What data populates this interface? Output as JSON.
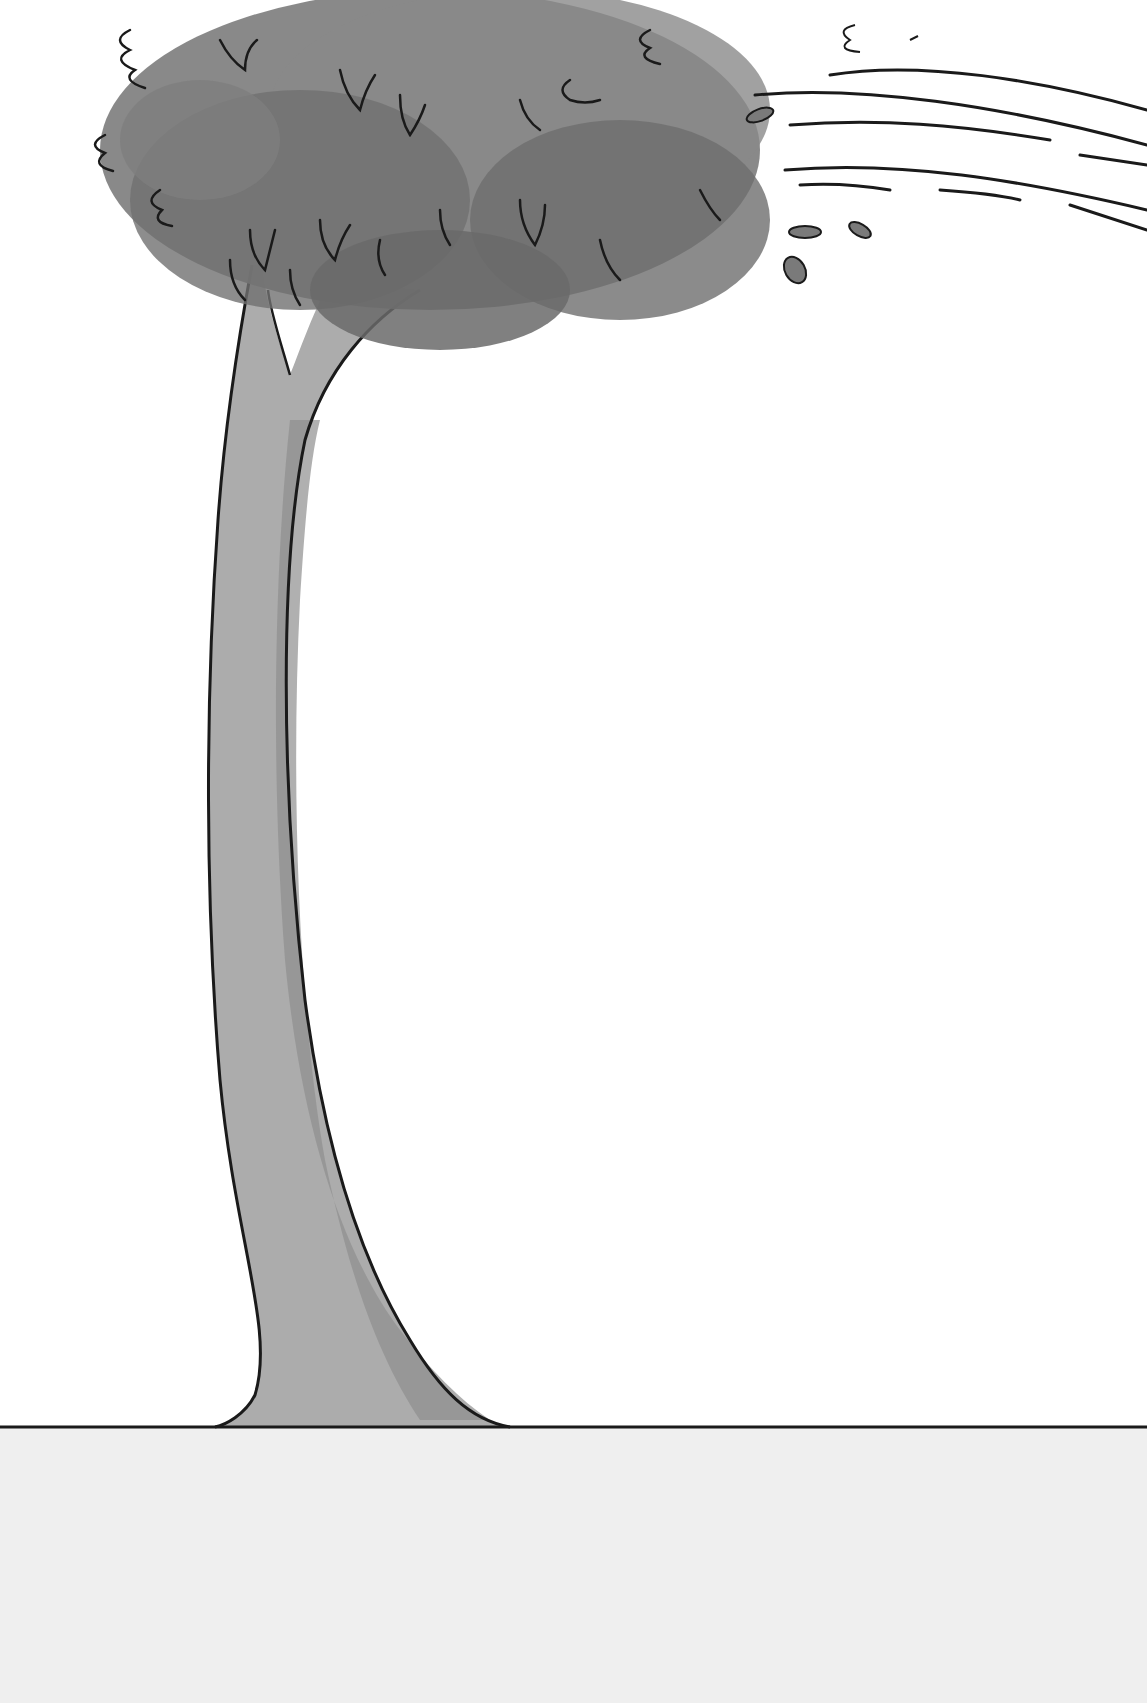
{
  "scene": {
    "description": "Watercolor illustration of a tall tree bending in the wind on flat ground",
    "colors": {
      "background": "#ffffff",
      "ground": "#efefef",
      "trunk": "#a9a9a9",
      "trunk_shade": "#8f8f8f",
      "foliage": "#7a7a7a",
      "foliage_dark": "#666666",
      "outline": "#1a1a1a"
    },
    "elements": [
      "tree-canopy",
      "tree-trunk",
      "wind-lines",
      "blowing-leaves",
      "ground-line",
      "ground"
    ]
  }
}
